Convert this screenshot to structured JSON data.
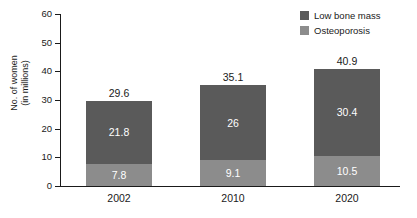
{
  "chart_data": {
    "type": "bar",
    "stacked": true,
    "title": "",
    "xlabel": "",
    "ylabel": "No. of women (in millions)",
    "ylabel_lines": [
      "No. of women",
      "(in millions)"
    ],
    "categories": [
      "2002",
      "2010",
      "2020"
    ],
    "ylim": [
      0,
      60
    ],
    "ytick_labels": [
      "0",
      "10",
      "20",
      "30",
      "40",
      "50",
      "60"
    ],
    "ytick_values": [
      0,
      10,
      20,
      30,
      40,
      50,
      60
    ],
    "grid": false,
    "legend_position": "top-right",
    "series": [
      {
        "name": "Low bone mass",
        "color": "#5a5a5a",
        "values": [
          21.8,
          26,
          30.4
        ],
        "value_labels": [
          "21.8",
          "26",
          "30.4"
        ]
      },
      {
        "name": "Osteoporosis",
        "color": "#8c8c8c",
        "values": [
          7.8,
          9.1,
          10.5
        ],
        "value_labels": [
          "7.8",
          "9.1",
          "10.5"
        ]
      }
    ],
    "totals": [
      29.6,
      35.1,
      40.9
    ],
    "total_labels": [
      "29.6",
      "35.1",
      "40.9"
    ]
  },
  "legend": {
    "items": [
      {
        "label": "Low bone mass",
        "color": "#5a5a5a"
      },
      {
        "label": "Osteoporosis",
        "color": "#8c8c8c"
      }
    ]
  },
  "axis": {
    "y_title_line1": "No. of women",
    "y_title_line2": "(in millions)"
  }
}
